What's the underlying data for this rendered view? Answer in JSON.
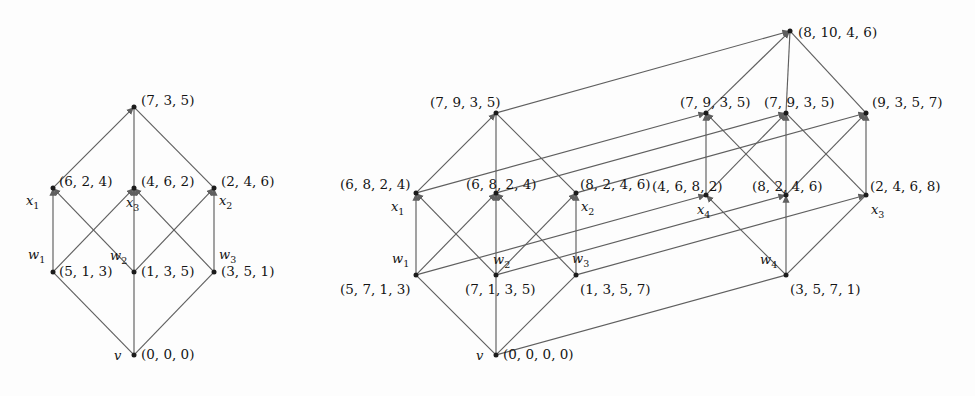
{
  "figure": {
    "kind": "hasse-style labelled digraph pair",
    "edge_color": "#5f5f5f",
    "node_color": "#1b1b1b",
    "background": "#fdfdfd"
  },
  "diagrams": [
    {
      "id": "left",
      "name": "three-dimensional-diagram",
      "nodes": [
        {
          "key": "v",
          "name": "node-v",
          "x": 134,
          "y": 355,
          "var": "v",
          "tuple": "(0, 0, 0)",
          "var_pos": {
            "x": 114,
            "y": 349
          },
          "tuple_pos": {
            "x": 141,
            "y": 348
          }
        },
        {
          "key": "w1",
          "name": "node-w1",
          "x": 53,
          "y": 272,
          "var": "w1",
          "tuple": "(5, 1, 3)",
          "var_pos": {
            "x": 28,
            "y": 248
          },
          "tuple_pos": {
            "x": 59,
            "y": 265
          }
        },
        {
          "key": "w2",
          "name": "node-w2",
          "x": 134,
          "y": 272,
          "var": "w2",
          "tuple": "(1, 3, 5)",
          "var_pos": {
            "x": 110,
            "y": 249
          },
          "tuple_pos": {
            "x": 141,
            "y": 265
          }
        },
        {
          "key": "w3",
          "name": "node-w3",
          "x": 214,
          "y": 272,
          "var": "w3",
          "tuple": "(3, 5, 1)",
          "var_pos": {
            "x": 219,
            "y": 248
          },
          "tuple_pos": {
            "x": 221,
            "y": 265
          }
        },
        {
          "key": "x1",
          "name": "node-x1",
          "x": 53,
          "y": 188,
          "var": "x1",
          "tuple": "(6, 2, 4)",
          "var_pos": {
            "x": 26,
            "y": 194
          },
          "tuple_pos": {
            "x": 59,
            "y": 175
          }
        },
        {
          "key": "x3",
          "name": "node-x3",
          "x": 134,
          "y": 188,
          "var": "x3",
          "tuple": "(4, 6, 2)",
          "var_pos": {
            "x": 126,
            "y": 196
          },
          "tuple_pos": {
            "x": 141,
            "y": 175
          }
        },
        {
          "key": "x2",
          "name": "node-x2",
          "x": 214,
          "y": 188,
          "var": "x2",
          "tuple": "(2, 4, 6)",
          "var_pos": {
            "x": 219,
            "y": 194
          },
          "tuple_pos": {
            "x": 221,
            "y": 175
          }
        },
        {
          "key": "top",
          "name": "node-top",
          "x": 134,
          "y": 107,
          "var": "",
          "tuple": "(7, 3, 5)",
          "var_pos": null,
          "tuple_pos": {
            "x": 141,
            "y": 94
          }
        }
      ],
      "edges": [
        {
          "from": "v",
          "to": "w1",
          "arrow": false
        },
        {
          "from": "v",
          "to": "w2",
          "arrow": false
        },
        {
          "from": "v",
          "to": "w3",
          "arrow": false
        },
        {
          "from": "w1",
          "to": "x1",
          "arrow": true
        },
        {
          "from": "w2",
          "to": "x3",
          "arrow": true
        },
        {
          "from": "w3",
          "to": "x2",
          "arrow": true
        },
        {
          "from": "w1",
          "to": "x3",
          "arrow": true
        },
        {
          "from": "w2",
          "to": "x2",
          "arrow": true
        },
        {
          "from": "w2",
          "to": "x1",
          "arrow": true
        },
        {
          "from": "w3",
          "to": "x3",
          "arrow": true
        },
        {
          "from": "x1",
          "to": "top",
          "arrow": true
        },
        {
          "from": "x3",
          "to": "top",
          "arrow": false
        },
        {
          "from": "x2",
          "to": "top",
          "arrow": false
        }
      ]
    },
    {
      "id": "right",
      "name": "four-dimensional-diagram",
      "nodes": [
        {
          "key": "v",
          "name": "node-v",
          "x": 496,
          "y": 355,
          "var": "v",
          "tuple": "(0, 0, 0, 0)",
          "var_pos": {
            "x": 476,
            "y": 349
          },
          "tuple_pos": {
            "x": 503,
            "y": 348
          }
        },
        {
          "key": "w1",
          "name": "node-w1",
          "x": 416,
          "y": 275,
          "var": "w1",
          "tuple": "(5, 7, 1, 3)",
          "var_pos": {
            "x": 392,
            "y": 252
          },
          "tuple_pos": {
            "x": 340,
            "y": 283
          }
        },
        {
          "key": "w2",
          "name": "node-w2",
          "x": 496,
          "y": 275,
          "var": "w2",
          "tuple": "(7, 1, 3, 5)",
          "var_pos": {
            "x": 493,
            "y": 253
          },
          "tuple_pos": {
            "x": 465,
            "y": 283
          }
        },
        {
          "key": "w3",
          "name": "node-w3",
          "x": 576,
          "y": 275,
          "var": "w3",
          "tuple": "(1, 3, 5, 7)",
          "var_pos": {
            "x": 572,
            "y": 252
          },
          "tuple_pos": {
            "x": 580,
            "y": 283
          }
        },
        {
          "key": "w4",
          "name": "node-w4",
          "x": 786,
          "y": 275,
          "var": "w4",
          "tuple": "(3, 5, 7, 1)",
          "var_pos": {
            "x": 760,
            "y": 253
          },
          "tuple_pos": {
            "x": 790,
            "y": 283
          }
        },
        {
          "key": "x1",
          "name": "node-x1",
          "x": 416,
          "y": 193,
          "var": "x1",
          "tuple": "(6, 8, 2, 4)",
          "var_pos": {
            "x": 391,
            "y": 200
          },
          "tuple_pos": {
            "x": 340,
            "y": 178
          }
        },
        {
          "key": "m1",
          "name": "node-mid-left",
          "x": 496,
          "y": 193,
          "var": "",
          "tuple": "(6, 8, 2, 4)",
          "var_pos": null,
          "tuple_pos": {
            "x": 466,
            "y": 178
          }
        },
        {
          "key": "x2",
          "name": "node-x2",
          "x": 576,
          "y": 193,
          "var": "x2",
          "tuple": "(8, 2, 4, 6)",
          "var_pos": {
            "x": 581,
            "y": 200
          },
          "tuple_pos": {
            "x": 580,
            "y": 178
          }
        },
        {
          "key": "x4",
          "name": "node-x4",
          "x": 706,
          "y": 195,
          "var": "x4",
          "tuple": "(4, 6, 8, 2)",
          "var_pos": {
            "x": 697,
            "y": 203
          },
          "tuple_pos": {
            "x": 652,
            "y": 180
          }
        },
        {
          "key": "m2",
          "name": "node-mid-right",
          "x": 786,
          "y": 195,
          "var": "",
          "tuple": "(8, 2, 4, 6)",
          "var_pos": null,
          "tuple_pos": {
            "x": 752,
            "y": 180
          }
        },
        {
          "key": "x3",
          "name": "node-x3",
          "x": 866,
          "y": 195,
          "var": "x3",
          "tuple": "(2, 4, 6, 8)",
          "var_pos": {
            "x": 871,
            "y": 203
          },
          "tuple_pos": {
            "x": 870,
            "y": 180
          }
        },
        {
          "key": "t1",
          "name": "node-top-front",
          "x": 496,
          "y": 113,
          "var": "",
          "tuple": "(7, 9, 3, 5)",
          "var_pos": null,
          "tuple_pos": {
            "x": 430,
            "y": 96
          }
        },
        {
          "key": "t2",
          "name": "node-top-mid-left",
          "x": 706,
          "y": 113,
          "var": "",
          "tuple": "(7, 9, 3, 5)",
          "var_pos": null,
          "tuple_pos": {
            "x": 680,
            "y": 96
          }
        },
        {
          "key": "t3",
          "name": "node-top-mid-right",
          "x": 786,
          "y": 113,
          "var": "",
          "tuple": "(7, 9, 3, 5)",
          "var_pos": null,
          "tuple_pos": {
            "x": 764,
            "y": 96
          }
        },
        {
          "key": "t4",
          "name": "node-top-back",
          "x": 866,
          "y": 113,
          "var": "",
          "tuple": "(9, 3, 5, 7)",
          "var_pos": null,
          "tuple_pos": {
            "x": 872,
            "y": 96
          }
        },
        {
          "key": "apex",
          "name": "node-apex",
          "x": 790,
          "y": 31,
          "var": "",
          "tuple": "(8, 10, 4, 6)",
          "var_pos": null,
          "tuple_pos": {
            "x": 798,
            "y": 26
          }
        }
      ],
      "edges": [
        {
          "from": "v",
          "to": "w1",
          "arrow": false
        },
        {
          "from": "v",
          "to": "w2",
          "arrow": false
        },
        {
          "from": "v",
          "to": "w3",
          "arrow": false
        },
        {
          "from": "v",
          "to": "w4",
          "arrow": false
        },
        {
          "from": "w1",
          "to": "x1",
          "arrow": true
        },
        {
          "from": "w2",
          "to": "m1",
          "arrow": true
        },
        {
          "from": "w3",
          "to": "x2",
          "arrow": true
        },
        {
          "from": "w4",
          "to": "m2",
          "arrow": true
        },
        {
          "from": "w1",
          "to": "m1",
          "arrow": true
        },
        {
          "from": "w2",
          "to": "x2",
          "arrow": true
        },
        {
          "from": "w2",
          "to": "x1",
          "arrow": true
        },
        {
          "from": "w3",
          "to": "m1",
          "arrow": true
        },
        {
          "from": "w4",
          "to": "x3",
          "arrow": false
        },
        {
          "from": "w4",
          "to": "x4",
          "arrow": true
        },
        {
          "from": "w1",
          "to": "x4",
          "arrow": true
        },
        {
          "from": "w2",
          "to": "m2",
          "arrow": true
        },
        {
          "from": "w3",
          "to": "x3",
          "arrow": true
        },
        {
          "from": "x1",
          "to": "t1",
          "arrow": true
        },
        {
          "from": "m1",
          "to": "t1",
          "arrow": false
        },
        {
          "from": "x2",
          "to": "t1",
          "arrow": false
        },
        {
          "from": "x4",
          "to": "t2",
          "arrow": true
        },
        {
          "from": "m2",
          "to": "t3",
          "arrow": true
        },
        {
          "from": "x3",
          "to": "t4",
          "arrow": true
        },
        {
          "from": "x4",
          "to": "t3",
          "arrow": true
        },
        {
          "from": "m2",
          "to": "t4",
          "arrow": true
        },
        {
          "from": "x3",
          "to": "t3",
          "arrow": false
        },
        {
          "from": "m2",
          "to": "t2",
          "arrow": true
        },
        {
          "from": "x1",
          "to": "t2",
          "arrow": true
        },
        {
          "from": "m1",
          "to": "t3",
          "arrow": true
        },
        {
          "from": "x2",
          "to": "t4",
          "arrow": true
        },
        {
          "from": "t2",
          "to": "apex",
          "arrow": true
        },
        {
          "from": "t3",
          "to": "apex",
          "arrow": false
        },
        {
          "from": "t4",
          "to": "apex",
          "arrow": false
        },
        {
          "from": "t1",
          "to": "apex",
          "arrow": true
        }
      ]
    }
  ]
}
